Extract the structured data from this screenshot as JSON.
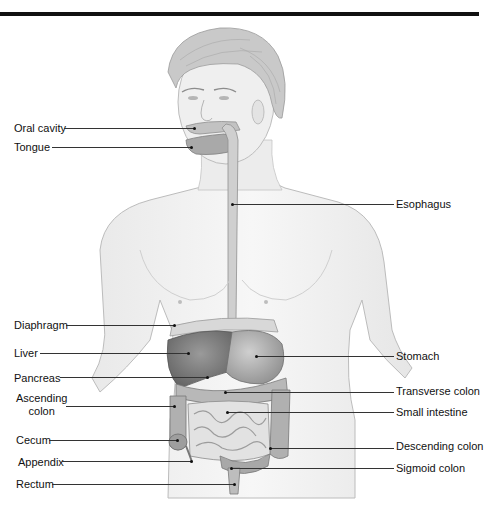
{
  "diagram": {
    "labels_left": [
      {
        "id": "oral-cavity",
        "text": "Oral cavity",
        "x": 14,
        "y": 122,
        "line_x1": 64,
        "line_x2": 194,
        "line_y": 128
      },
      {
        "id": "tongue",
        "text": "Tongue",
        "x": 14,
        "y": 141,
        "line_x1": 52,
        "line_x2": 191,
        "line_y": 147
      },
      {
        "id": "diaphragm",
        "text": "Diaphragm",
        "x": 14,
        "y": 319,
        "line_x1": 66,
        "line_x2": 174,
        "line_y": 325
      },
      {
        "id": "liver",
        "text": "Liver",
        "x": 14,
        "y": 347,
        "line_x1": 40,
        "line_x2": 188,
        "line_y": 353
      },
      {
        "id": "pancreas",
        "text": "Pancreas",
        "x": 14,
        "y": 372,
        "line_x1": 60,
        "line_x2": 207,
        "line_y": 377
      },
      {
        "id": "ascending-colon",
        "text": "Ascending\ncolon",
        "x": 16,
        "y": 392,
        "line_x1": 66,
        "line_x2": 174,
        "line_y": 406
      },
      {
        "id": "cecum",
        "text": "Cecum",
        "x": 16,
        "y": 434,
        "line_x1": 49,
        "line_x2": 177,
        "line_y": 440
      },
      {
        "id": "appendix",
        "text": "Appendix",
        "x": 18,
        "y": 456,
        "line_x1": 62,
        "line_x2": 191,
        "line_y": 461
      },
      {
        "id": "rectum",
        "text": "Rectum",
        "x": 16,
        "y": 478,
        "line_x1": 52,
        "line_x2": 234,
        "line_y": 484
      }
    ],
    "labels_right": [
      {
        "id": "esophagus",
        "text": "Esophagus",
        "x": 396,
        "y": 198,
        "line_x1": 232,
        "line_x2": 394,
        "line_y": 204
      },
      {
        "id": "stomach",
        "text": "Stomach",
        "x": 396,
        "y": 350,
        "line_x1": 256,
        "line_x2": 394,
        "line_y": 356
      },
      {
        "id": "transverse-colon",
        "text": "Transverse colon",
        "x": 396,
        "y": 385,
        "line_x1": 225,
        "line_x2": 394,
        "line_y": 392
      },
      {
        "id": "small-intestine",
        "text": "Small intestine",
        "x": 396,
        "y": 406,
        "line_x1": 227,
        "line_x2": 394,
        "line_y": 412
      },
      {
        "id": "descending-colon",
        "text": "Descending colon",
        "x": 396,
        "y": 440,
        "line_x1": 270,
        "line_x2": 394,
        "line_y": 448
      },
      {
        "id": "sigmoid-colon",
        "text": "Sigmoid colon",
        "x": 396,
        "y": 462,
        "line_x1": 231,
        "line_x2": 394,
        "line_y": 468
      }
    ]
  }
}
